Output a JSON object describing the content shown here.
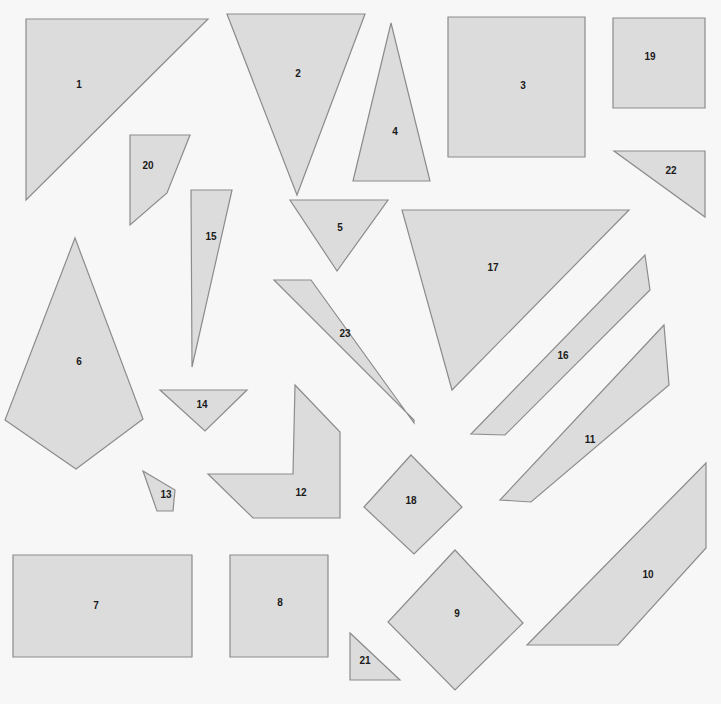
{
  "canvas": {
    "width": 721,
    "height": 704,
    "background_color": "#f7f7f7",
    "shape_fill_color": "#dcdcdc",
    "shape_stroke_color": "#8c8c8c",
    "label_color": "#1a1a1a",
    "stroke_width": 1.2,
    "label_font_size": 10,
    "shape_count": 23
  },
  "shapes": [
    {
      "id": "1",
      "label": "1",
      "kind": "triangle",
      "points": "26,19 208,19 26,200",
      "label_x": 79,
      "label_y": 85
    },
    {
      "id": "2",
      "label": "2",
      "kind": "triangle",
      "points": "227,14 365,14 297,195",
      "label_x": 298,
      "label_y": 74
    },
    {
      "id": "3",
      "label": "3",
      "kind": "rectangle",
      "points": "448,17 585,17 585,157 448,157",
      "label_x": 523,
      "label_y": 86
    },
    {
      "id": "4",
      "label": "4",
      "kind": "triangle",
      "points": "391,23 430,181 353,181",
      "label_x": 395,
      "label_y": 132
    },
    {
      "id": "5",
      "label": "5",
      "kind": "triangle",
      "points": "290,200 388,200 337,271",
      "label_x": 340,
      "label_y": 228
    },
    {
      "id": "6",
      "label": "6",
      "kind": "kite",
      "points": "75,238 143,419 76,469 5,420",
      "label_x": 79,
      "label_y": 362
    },
    {
      "id": "7",
      "label": "7",
      "kind": "rectangle",
      "points": "13,555 192,555 192,657 13,657",
      "label_x": 96,
      "label_y": 606
    },
    {
      "id": "8",
      "label": "8",
      "kind": "rectangle",
      "points": "230,555 328,555 328,657 230,657",
      "label_x": 280,
      "label_y": 603
    },
    {
      "id": "9",
      "label": "9",
      "kind": "diamond",
      "points": "455,550 523,623 455,690 388,622",
      "label_x": 457,
      "label_y": 614
    },
    {
      "id": "10",
      "label": "10",
      "kind": "quadrilateral",
      "points": "706,463 706,548 618,645 527,645",
      "label_x": 648,
      "label_y": 575
    },
    {
      "id": "11",
      "label": "11",
      "kind": "parallelogram",
      "points": "664,325 669,385 531,502 500,500",
      "label_x": 590,
      "label_y": 440
    },
    {
      "id": "12",
      "label": "12",
      "kind": "chevron",
      "points": "295,385 340,432 340,518 253,518 208,474 293,474",
      "label_x": 301,
      "label_y": 493
    },
    {
      "id": "13",
      "label": "13",
      "kind": "quadrilateral",
      "points": "143,471 175,490 173,511 157,511",
      "label_x": 166,
      "label_y": 495
    },
    {
      "id": "14",
      "label": "14",
      "kind": "triangle",
      "points": "160,390 247,390 205,431",
      "label_x": 202,
      "label_y": 405
    },
    {
      "id": "15",
      "label": "15",
      "kind": "triangle",
      "points": "191,190 232,190 192,367",
      "label_x": 211,
      "label_y": 237
    },
    {
      "id": "16",
      "label": "16",
      "kind": "parallelogram",
      "points": "645,255 650,290 505,435 471,434",
      "label_x": 563,
      "label_y": 356
    },
    {
      "id": "17",
      "label": "17",
      "kind": "triangle",
      "points": "402,210 629,210 452,390",
      "label_x": 493,
      "label_y": 268
    },
    {
      "id": "18",
      "label": "18",
      "kind": "diamond",
      "points": "411,455 462,507 414,554 364,507",
      "label_x": 411,
      "label_y": 501
    },
    {
      "id": "19",
      "label": "19",
      "kind": "rectangle",
      "points": "613,18 705,18 705,108 613,108",
      "label_x": 650,
      "label_y": 57
    },
    {
      "id": "20",
      "label": "20",
      "kind": "quadrilateral",
      "points": "130,135 190,135 167,193 130,225",
      "label_x": 148,
      "label_y": 166
    },
    {
      "id": "21",
      "label": "21",
      "kind": "triangle",
      "points": "350,633 350,680 400,680",
      "label_x": 365,
      "label_y": 661
    },
    {
      "id": "22",
      "label": "22",
      "kind": "triangle",
      "points": "614,151 705,151 705,217",
      "label_x": 671,
      "label_y": 171
    },
    {
      "id": "23",
      "label": "23",
      "kind": "parallelogram",
      "points": "274,280 311,280 414,423 414,420",
      "label_x": 345,
      "label_y": 334
    }
  ]
}
